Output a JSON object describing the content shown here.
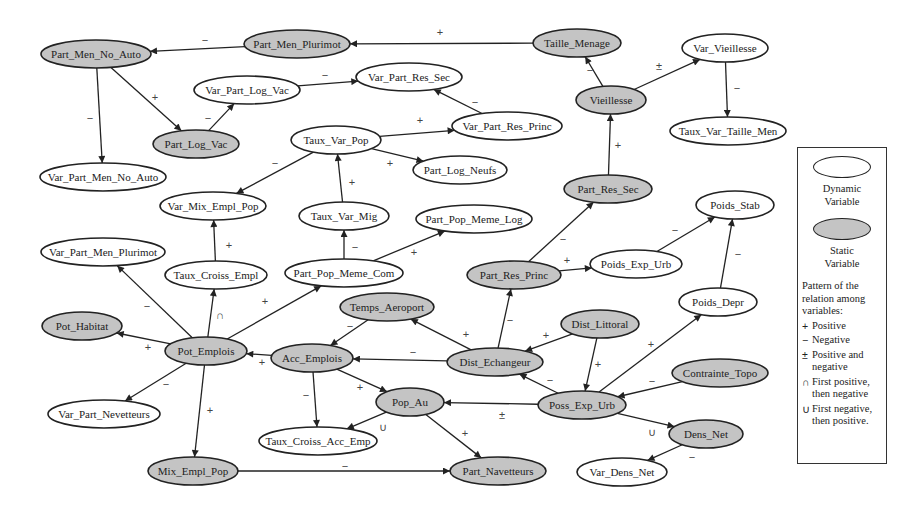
{
  "diagram": {
    "nodes": [
      {
        "id": "Part_Men_No_Auto",
        "label": "Part_Men_No_Auto",
        "type": "static",
        "x": 96,
        "y": 54,
        "rx": 55,
        "ry": 14
      },
      {
        "id": "Part_Men_Plurimot",
        "label": "Part_Men_Plurimot",
        "type": "static",
        "x": 297,
        "y": 44,
        "rx": 53,
        "ry": 14
      },
      {
        "id": "Taille_Menage",
        "label": "Taille_Menage",
        "type": "static",
        "x": 577,
        "y": 43,
        "rx": 44,
        "ry": 14
      },
      {
        "id": "Var_Vieillesse",
        "label": "Var_Vieillesse",
        "type": "dynamic",
        "x": 725,
        "y": 48,
        "rx": 43,
        "ry": 14
      },
      {
        "id": "Var_Part_Log_Vac",
        "label": "Var_Part_Log_Vac",
        "type": "dynamic",
        "x": 247,
        "y": 90,
        "rx": 53,
        "ry": 14
      },
      {
        "id": "Var_Part_Res_Sec",
        "label": "Var_Part_Res_Sec",
        "type": "dynamic",
        "x": 409,
        "y": 77,
        "rx": 53,
        "ry": 14
      },
      {
        "id": "Vieillesse",
        "label": "Vieillesse",
        "type": "static",
        "x": 611,
        "y": 100,
        "rx": 35,
        "ry": 14
      },
      {
        "id": "Part_Log_Vac",
        "label": "Part_Log_Vac",
        "type": "static",
        "x": 196,
        "y": 144,
        "rx": 43,
        "ry": 14
      },
      {
        "id": "Taux_Var_Pop",
        "label": "Taux_Var_Pop",
        "type": "dynamic",
        "x": 336,
        "y": 140,
        "rx": 45,
        "ry": 14
      },
      {
        "id": "Var_Part_Res_Princ",
        "label": "Var_Part_Res_Princ",
        "type": "dynamic",
        "x": 507,
        "y": 126,
        "rx": 55,
        "ry": 14
      },
      {
        "id": "Taux_Var_Taille_Men",
        "label": "Taux_Var_Taille_Men",
        "type": "dynamic",
        "x": 728,
        "y": 131,
        "rx": 58,
        "ry": 14
      },
      {
        "id": "Part_Log_Neufs",
        "label": "Part_Log_Neufs",
        "type": "dynamic",
        "x": 460,
        "y": 170,
        "rx": 47,
        "ry": 14
      },
      {
        "id": "Var_Part_Men_No_Auto",
        "label": "Var_Part_Men_No_Auto",
        "type": "dynamic",
        "x": 103,
        "y": 177,
        "rx": 63,
        "ry": 14
      },
      {
        "id": "Part_Res_Sec",
        "label": "Part_Res_Sec",
        "type": "static",
        "x": 608,
        "y": 189,
        "rx": 44,
        "ry": 14
      },
      {
        "id": "Var_Mix_Empl_Pop",
        "label": "Var_Mix_Empl_Pop",
        "type": "dynamic",
        "x": 213,
        "y": 206,
        "rx": 53,
        "ry": 14
      },
      {
        "id": "Poids_Stab",
        "label": "Poids_Stab",
        "type": "dynamic",
        "x": 735,
        "y": 205,
        "rx": 39,
        "ry": 14
      },
      {
        "id": "Taux_Var_Mig",
        "label": "Taux_Var_Mig",
        "type": "dynamic",
        "x": 344,
        "y": 216,
        "rx": 45,
        "ry": 14
      },
      {
        "id": "Part_Pop_Meme_Log",
        "label": "Part_Pop_Meme_Log",
        "type": "dynamic",
        "x": 474,
        "y": 219,
        "rx": 58,
        "ry": 14
      },
      {
        "id": "Var_Part_Men_Plurimot",
        "label": "Var_Part_Men_Plurimot",
        "type": "dynamic",
        "x": 103,
        "y": 252,
        "rx": 62,
        "ry": 14
      },
      {
        "id": "Taux_Croiss_Empl",
        "label": "Taux_Croiss_Empl",
        "type": "dynamic",
        "x": 216,
        "y": 275,
        "rx": 51,
        "ry": 14
      },
      {
        "id": "Part_Pop_Meme_Com",
        "label": "Part_Pop_Meme_Com",
        "type": "dynamic",
        "x": 344,
        "y": 273,
        "rx": 59,
        "ry": 14
      },
      {
        "id": "Part_Res_Princ",
        "label": "Part_Res_Princ",
        "type": "static",
        "x": 514,
        "y": 275,
        "rx": 47,
        "ry": 14
      },
      {
        "id": "Poids_Exp_Urb",
        "label": "Poids_Exp_Urb",
        "type": "dynamic",
        "x": 636,
        "y": 264,
        "rx": 46,
        "ry": 14
      },
      {
        "id": "Temps_Aeroport",
        "label": "Temps_Aeroport",
        "type": "static",
        "x": 387,
        "y": 307,
        "rx": 47,
        "ry": 14
      },
      {
        "id": "Poids_Depr",
        "label": "Poids_Depr",
        "type": "dynamic",
        "x": 718,
        "y": 302,
        "rx": 39,
        "ry": 14
      },
      {
        "id": "Pot_Habitat",
        "label": "Pot_Habitat",
        "type": "static",
        "x": 82,
        "y": 326,
        "rx": 40,
        "ry": 14
      },
      {
        "id": "Pot_Emplois",
        "label": "Pot_Emplois",
        "type": "static",
        "x": 206,
        "y": 351,
        "rx": 41,
        "ry": 14
      },
      {
        "id": "Acc_Emplois",
        "label": "Acc_Emplois",
        "type": "static",
        "x": 312,
        "y": 358,
        "rx": 41,
        "ry": 14
      },
      {
        "id": "Dist_Littoral",
        "label": "Dist_Littoral",
        "type": "static",
        "x": 600,
        "y": 324,
        "rx": 39,
        "ry": 14
      },
      {
        "id": "Dist_Echangeur",
        "label": "Dist_Echangeur",
        "type": "static",
        "x": 495,
        "y": 362,
        "rx": 48,
        "ry": 14
      },
      {
        "id": "Contrainte_Topo",
        "label": "Contrainte_Topo",
        "type": "static",
        "x": 720,
        "y": 373,
        "rx": 48,
        "ry": 14
      },
      {
        "id": "Pop_Au",
        "label": "Pop_Au",
        "type": "static",
        "x": 410,
        "y": 402,
        "rx": 34,
        "ry": 14
      },
      {
        "id": "Poss_Exp_Urb",
        "label": "Poss_Exp_Urb",
        "type": "static",
        "x": 582,
        "y": 405,
        "rx": 44,
        "ry": 14
      },
      {
        "id": "Var_Part_Nevetteurs",
        "label": "Var_Part_Nevetteurs",
        "type": "dynamic",
        "x": 104,
        "y": 414,
        "rx": 56,
        "ry": 14
      },
      {
        "id": "Taux_Croiss_Acc_Emp",
        "label": "Taux_Croiss_Acc_Emp",
        "type": "dynamic",
        "x": 318,
        "y": 441,
        "rx": 59,
        "ry": 14
      },
      {
        "id": "Dens_Net",
        "label": "Dens_Net",
        "type": "static",
        "x": 706,
        "y": 434,
        "rx": 37,
        "ry": 14
      },
      {
        "id": "Mix_Empl_Pop",
        "label": "Mix_Empl_Pop",
        "type": "static",
        "x": 193,
        "y": 471,
        "rx": 45,
        "ry": 14
      },
      {
        "id": "Part_Navetteurs",
        "label": "Part_Navetteurs",
        "type": "static",
        "x": 498,
        "y": 471,
        "rx": 48,
        "ry": 14
      },
      {
        "id": "Var_Dens_Net",
        "label": "Var_Dens_Net",
        "type": "dynamic",
        "x": 622,
        "y": 472,
        "rx": 45,
        "ry": 14
      }
    ],
    "edges": [
      {
        "from": "Part_Men_Plurimot",
        "to": "Part_Men_No_Auto",
        "sign": "−",
        "lx": 205,
        "ly": 40
      },
      {
        "from": "Taille_Menage",
        "to": "Part_Men_Plurimot",
        "sign": "+",
        "lx": 440,
        "ly": 32
      },
      {
        "from": "Part_Men_No_Auto",
        "to": "Var_Part_Men_No_Auto",
        "sign": "−",
        "lx": 90,
        "ly": 118
      },
      {
        "from": "Part_Men_No_Auto",
        "to": "Part_Log_Vac",
        "sign": "+",
        "lx": 155,
        "ly": 97
      },
      {
        "from": "Part_Log_Vac",
        "to": "Var_Part_Log_Vac",
        "sign": "−",
        "lx": 208,
        "ly": 118
      },
      {
        "from": "Var_Part_Log_Vac",
        "to": "Var_Part_Res_Sec",
        "sign": "−",
        "lx": 325,
        "ly": 75
      },
      {
        "from": "Var_Part_Res_Princ",
        "to": "Var_Part_Res_Sec",
        "sign": "−",
        "lx": 475,
        "ly": 102
      },
      {
        "from": "Taux_Var_Pop",
        "to": "Var_Part_Res_Princ",
        "sign": "+",
        "lx": 420,
        "ly": 120
      },
      {
        "from": "Taux_Var_Pop",
        "to": "Part_Log_Neufs",
        "sign": "+",
        "lx": 390,
        "ly": 163
      },
      {
        "from": "Taux_Var_Pop",
        "to": "Var_Mix_Empl_Pop",
        "sign": "−",
        "lx": 275,
        "ly": 163
      },
      {
        "from": "Taux_Var_Mig",
        "to": "Taux_Var_Pop",
        "sign": "+",
        "lx": 352,
        "ly": 182
      },
      {
        "from": "Part_Pop_Meme_Com",
        "to": "Taux_Var_Mig",
        "sign": "−",
        "lx": 355,
        "ly": 247
      },
      {
        "from": "Part_Pop_Meme_Com",
        "to": "Part_Pop_Meme_Log",
        "sign": "+",
        "lx": 414,
        "ly": 252
      },
      {
        "from": "Vieillesse",
        "to": "Taille_Menage",
        "sign": "−",
        "lx": 590,
        "ly": 70
      },
      {
        "from": "Vieillesse",
        "to": "Var_Vieillesse",
        "sign": "±",
        "lx": 659,
        "ly": 66
      },
      {
        "from": "Var_Vieillesse",
        "to": "Taux_Var_Taille_Men",
        "sign": "−",
        "lx": 737,
        "ly": 88
      },
      {
        "from": "Part_Res_Sec",
        "to": "Vieillesse",
        "sign": "+",
        "lx": 618,
        "ly": 145
      },
      {
        "from": "Part_Res_Princ",
        "to": "Part_Res_Sec",
        "sign": "−",
        "lx": 563,
        "ly": 239
      },
      {
        "from": "Part_Res_Princ",
        "to": "Poids_Exp_Urb",
        "sign": "+",
        "lx": 567,
        "ly": 260
      },
      {
        "from": "Poids_Exp_Urb",
        "to": "Poids_Stab",
        "sign": "−",
        "lx": 675,
        "ly": 230
      },
      {
        "from": "Poids_Depr",
        "to": "Poids_Stab",
        "sign": "−",
        "lx": 738,
        "ly": 254
      },
      {
        "from": "Taux_Croiss_Empl",
        "to": "Var_Mix_Empl_Pop",
        "sign": "+",
        "lx": 229,
        "ly": 245
      },
      {
        "from": "Pot_Emplois",
        "to": "Taux_Croiss_Empl",
        "sign": "∩",
        "lx": 220,
        "ly": 315
      },
      {
        "from": "Pot_Emplois",
        "to": "Var_Part_Men_Plurimot",
        "sign": "−",
        "lx": 147,
        "ly": 306
      },
      {
        "from": "Pot_Emplois",
        "to": "Part_Pop_Meme_Com",
        "sign": "+",
        "lx": 265,
        "ly": 301
      },
      {
        "from": "Pot_Emplois",
        "to": "Pot_Habitat",
        "sign": "+",
        "lx": 148,
        "ly": 347
      },
      {
        "from": "Pot_Emplois",
        "to": "Var_Part_Nevetteurs",
        "sign": "−",
        "lx": 166,
        "ly": 384
      },
      {
        "from": "Pot_Emplois",
        "to": "Mix_Empl_Pop",
        "sign": "+",
        "lx": 210,
        "ly": 410
      },
      {
        "from": "Acc_Emplois",
        "to": "Pot_Emplois",
        "sign": "+",
        "lx": 262,
        "ly": 362
      },
      {
        "from": "Temps_Aeroport",
        "to": "Acc_Emplois",
        "sign": "−",
        "lx": 350,
        "ly": 326
      },
      {
        "from": "Dist_Echangeur",
        "to": "Temps_Aeroport",
        "sign": "+",
        "lx": 466,
        "ly": 334
      },
      {
        "from": "Dist_Echangeur",
        "to": "Acc_Emplois",
        "sign": "−",
        "lx": 413,
        "ly": 352
      },
      {
        "from": "Dist_Echangeur",
        "to": "Part_Res_Princ",
        "sign": "−",
        "lx": 510,
        "ly": 320
      },
      {
        "from": "Acc_Emplois",
        "to": "Taux_Croiss_Acc_Emp",
        "sign": "−",
        "lx": 306,
        "ly": 395
      },
      {
        "from": "Acc_Emplois",
        "to": "Pop_Au",
        "sign": "+",
        "lx": 360,
        "ly": 387
      },
      {
        "from": "Pop_Au",
        "to": "Taux_Croiss_Acc_Emp",
        "sign": "∪",
        "lx": 383,
        "ly": 427
      },
      {
        "from": "Pop_Au",
        "to": "Part_Navetteurs",
        "sign": "+",
        "lx": 465,
        "ly": 433
      },
      {
        "from": "Poss_Exp_Urb",
        "to": "Pop_Au",
        "sign": "±",
        "lx": 502,
        "ly": 415
      },
      {
        "from": "Dist_Littoral",
        "to": "Dist_Echangeur",
        "sign": "+",
        "lx": 546,
        "ly": 335
      },
      {
        "from": "Dist_Littoral",
        "to": "Poss_Exp_Urb",
        "sign": "+",
        "lx": 598,
        "ly": 364
      },
      {
        "from": "Poss_Exp_Urb",
        "to": "Dist_Echangeur",
        "sign": "−",
        "lx": 550,
        "ly": 380
      },
      {
        "from": "Poss_Exp_Urb",
        "to": "Poids_Depr",
        "sign": "+",
        "lx": 651,
        "ly": 344
      },
      {
        "from": "Contrainte_Topo",
        "to": "Poss_Exp_Urb",
        "sign": "−",
        "lx": 652,
        "ly": 381
      },
      {
        "from": "Poss_Exp_Urb",
        "to": "Dens_Net",
        "sign": "∪",
        "lx": 652,
        "ly": 432
      },
      {
        "from": "Dens_Net",
        "to": "Var_Dens_Net",
        "sign": "−",
        "lx": 692,
        "ly": 457
      },
      {
        "from": "Mix_Empl_Pop",
        "to": "Part_Navetteurs",
        "sign": "−",
        "lx": 345,
        "ly": 466
      }
    ]
  },
  "legend": {
    "dynamic_caption_line1": "Dynamic",
    "dynamic_caption_line2": "Variable",
    "static_caption_line1": "Static",
    "static_caption_line2": "Variable",
    "heading": "Pattern of the relation among variables:",
    "items": [
      {
        "symbol": "+",
        "text": "Positive"
      },
      {
        "symbol": "−",
        "text": "Negative"
      },
      {
        "symbol": "±",
        "text": "Positive and negative"
      },
      {
        "symbol": "∩",
        "text": "First positive, then negative"
      },
      {
        "symbol": "∪",
        "text": "First negative, then positive."
      }
    ]
  },
  "colors": {
    "static_fill": "#c4c4c4",
    "dynamic_fill": "#ffffff",
    "stroke": "#222222"
  }
}
